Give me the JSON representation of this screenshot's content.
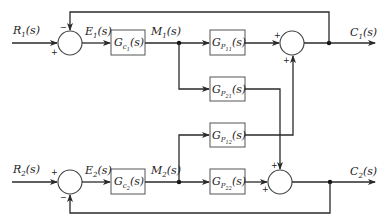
{
  "diagram": {
    "type": "MIMO block diagram (2x2 feedback control)",
    "inputs": [
      {
        "id": "R1",
        "main": "R",
        "sub": "1",
        "tail": "(s)"
      },
      {
        "id": "R2",
        "main": "R",
        "sub": "2",
        "tail": "(s)"
      }
    ],
    "errors": [
      {
        "id": "E1",
        "main": "E",
        "sub": "1",
        "tail": "(s)"
      },
      {
        "id": "E2",
        "main": "E",
        "sub": "2",
        "tail": "(s)"
      }
    ],
    "manipulated": [
      {
        "id": "M1",
        "main": "M",
        "sub": "1",
        "tail": "(s)"
      },
      {
        "id": "M2",
        "main": "M",
        "sub": "2",
        "tail": "(s)"
      }
    ],
    "outputs": [
      {
        "id": "C1",
        "main": "C",
        "sub": "1",
        "tail": "(s)"
      },
      {
        "id": "C2",
        "main": "C",
        "sub": "2",
        "tail": "(s)"
      }
    ],
    "controllers": [
      {
        "id": "Gc1",
        "main": "G",
        "sub": "c",
        "subsub": "1",
        "tail": "(s)"
      },
      {
        "id": "Gc2",
        "main": "G",
        "sub": "c",
        "subsub": "2",
        "tail": "(s)"
      }
    ],
    "processes": [
      {
        "id": "Gp11",
        "main": "G",
        "sub": "P",
        "subsub": "11",
        "tail": "(s)"
      },
      {
        "id": "Gp21",
        "main": "G",
        "sub": "P",
        "subsub": "21",
        "tail": "(s)"
      },
      {
        "id": "Gp12",
        "main": "G",
        "sub": "P",
        "subsub": "12",
        "tail": "(s)"
      },
      {
        "id": "Gp22",
        "main": "G",
        "sub": "P",
        "subsub": "22",
        "tail": "(s)"
      }
    ],
    "signs": {
      "sum1_feedback": "−",
      "sum1_input": "+",
      "sum2_input": "+",
      "sum2_feedback": "−",
      "sum3_a": "+",
      "sum3_b": "+",
      "sum4_a": "+",
      "sum4_b": "+"
    },
    "connections": [
      "R1 -> Sum1(+)",
      "C1 -> Sum1(-)",
      "Sum1 -> E1 -> Gc1 -> M1",
      "M1 -> Gp11 -> Sum3(+)",
      "M1 -> Gp21 -> Sum4(+)",
      "M2 -> Gp12 -> Sum3(+)",
      "M2 -> Gp22 -> Sum4(+)",
      "Sum3 -> C1",
      "Sum4 -> C2",
      "R2 -> Sum2(+)",
      "C2 -> Sum2(-)",
      "Sum2 -> E2 -> Gc2 -> M2"
    ]
  }
}
